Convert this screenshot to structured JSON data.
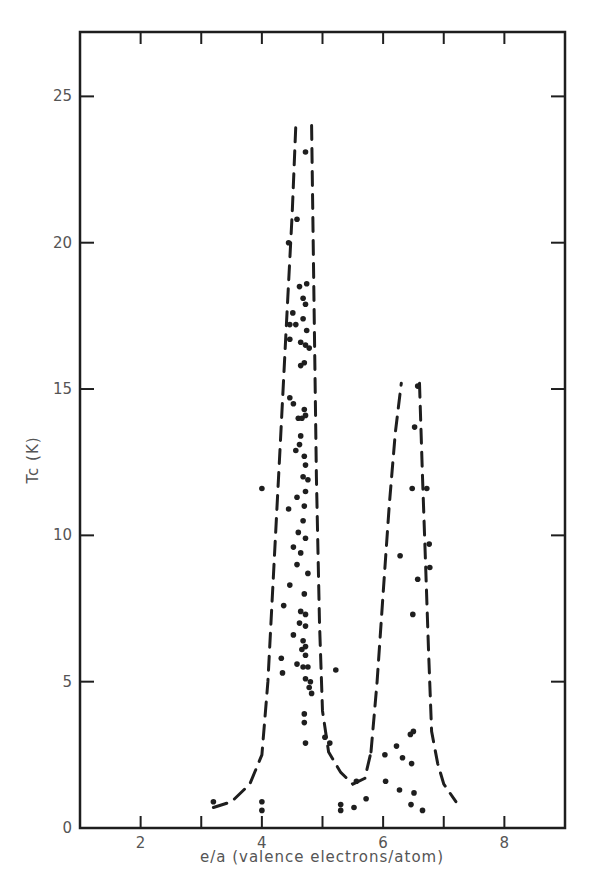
{
  "chart_data": {
    "type": "scatter",
    "title": "",
    "xlabel": "e/a (valence electrons/atom)",
    "ylabel": "Tc (K)",
    "xlim": [
      1,
      9
    ],
    "ylim": [
      0,
      27.2
    ],
    "x_ticks": [
      2,
      3,
      4,
      5,
      6,
      7,
      8
    ],
    "x_tick_labels": [
      "2",
      "",
      "4",
      "",
      "6",
      "",
      "8"
    ],
    "y_ticks": [
      0,
      5,
      10,
      15,
      20,
      25
    ],
    "y_tick_labels": [
      "0",
      "5",
      "10",
      "15",
      "20",
      "25"
    ],
    "grid": false,
    "legend": null,
    "series": [
      {
        "name": "superconductors",
        "style": "scatter",
        "points": [
          [
            3.2,
            0.9
          ],
          [
            4.0,
            0.9
          ],
          [
            4.0,
            0.6
          ],
          [
            4.0,
            11.6
          ],
          [
            4.72,
            23.1
          ],
          [
            4.58,
            20.8
          ],
          [
            4.44,
            20.0
          ],
          [
            4.62,
            18.5
          ],
          [
            4.74,
            18.6
          ],
          [
            4.68,
            18.1
          ],
          [
            4.72,
            17.9
          ],
          [
            4.51,
            17.6
          ],
          [
            4.68,
            17.4
          ],
          [
            4.56,
            17.2
          ],
          [
            4.46,
            17.2
          ],
          [
            4.74,
            17.0
          ],
          [
            4.46,
            16.7
          ],
          [
            4.64,
            16.6
          ],
          [
            4.72,
            16.5
          ],
          [
            4.78,
            16.4
          ],
          [
            4.7,
            15.9
          ],
          [
            4.64,
            15.8
          ],
          [
            4.46,
            14.7
          ],
          [
            4.52,
            14.5
          ],
          [
            4.7,
            14.3
          ],
          [
            4.6,
            14.0
          ],
          [
            4.66,
            14.0
          ],
          [
            4.72,
            14.1
          ],
          [
            4.64,
            13.4
          ],
          [
            4.62,
            13.1
          ],
          [
            4.56,
            12.9
          ],
          [
            4.7,
            12.7
          ],
          [
            4.72,
            12.4
          ],
          [
            4.68,
            12.0
          ],
          [
            4.76,
            11.9
          ],
          [
            4.58,
            11.3
          ],
          [
            4.72,
            11.5
          ],
          [
            4.7,
            11.0
          ],
          [
            4.44,
            10.9
          ],
          [
            4.68,
            10.5
          ],
          [
            4.6,
            10.1
          ],
          [
            4.72,
            9.9
          ],
          [
            4.52,
            9.6
          ],
          [
            4.64,
            9.4
          ],
          [
            4.58,
            9.0
          ],
          [
            4.76,
            8.7
          ],
          [
            4.46,
            8.3
          ],
          [
            4.7,
            8.0
          ],
          [
            4.36,
            7.6
          ],
          [
            4.64,
            7.4
          ],
          [
            4.72,
            7.3
          ],
          [
            4.62,
            7.0
          ],
          [
            4.72,
            6.9
          ],
          [
            4.52,
            6.6
          ],
          [
            4.68,
            6.4
          ],
          [
            4.66,
            6.1
          ],
          [
            4.72,
            5.9
          ],
          [
            4.72,
            6.2
          ],
          [
            4.32,
            5.8
          ],
          [
            4.58,
            5.6
          ],
          [
            4.68,
            5.5
          ],
          [
            4.76,
            5.5
          ],
          [
            4.34,
            5.3
          ],
          [
            4.72,
            5.1
          ],
          [
            4.8,
            5.0
          ],
          [
            4.78,
            4.8
          ],
          [
            4.82,
            4.6
          ],
          [
            5.22,
            5.4
          ],
          [
            4.7,
            3.9
          ],
          [
            4.7,
            3.6
          ],
          [
            5.04,
            3.1
          ],
          [
            4.72,
            2.9
          ],
          [
            5.12,
            2.9
          ],
          [
            5.3,
            0.8
          ],
          [
            5.3,
            0.6
          ],
          [
            5.52,
            0.7
          ],
          [
            5.72,
            1.0
          ],
          [
            5.56,
            1.6
          ],
          [
            6.03,
            2.5
          ],
          [
            6.04,
            1.6
          ],
          [
            6.22,
            2.8
          ],
          [
            6.32,
            2.4
          ],
          [
            6.45,
            3.2
          ],
          [
            6.5,
            3.3
          ],
          [
            6.27,
            1.3
          ],
          [
            6.47,
            2.2
          ],
          [
            6.51,
            1.2
          ],
          [
            6.46,
            0.8
          ],
          [
            6.65,
            0.6
          ],
          [
            6.28,
            9.3
          ],
          [
            6.48,
            11.6
          ],
          [
            6.49,
            7.3
          ],
          [
            6.57,
            8.5
          ],
          [
            6.57,
            15.1
          ],
          [
            6.52,
            13.7
          ],
          [
            6.72,
            11.6
          ],
          [
            6.76,
            9.7
          ],
          [
            6.77,
            8.9
          ]
        ]
      },
      {
        "name": "envelope-peak-1",
        "style": "dashed",
        "points": [
          [
            3.2,
            0.7
          ],
          [
            3.5,
            0.9
          ],
          [
            3.8,
            1.5
          ],
          [
            4.0,
            2.5
          ],
          [
            4.1,
            5.0
          ],
          [
            4.2,
            9.0
          ],
          [
            4.3,
            13.0
          ],
          [
            4.4,
            17.0
          ],
          [
            4.5,
            21.0
          ],
          [
            4.56,
            24.0
          ]
        ]
      },
      {
        "name": "envelope-peak-1-right",
        "style": "dashed",
        "points": [
          [
            4.82,
            24.0
          ],
          [
            4.86,
            18.0
          ],
          [
            4.9,
            12.0
          ],
          [
            4.95,
            7.0
          ],
          [
            5.0,
            4.0
          ],
          [
            5.1,
            2.6
          ],
          [
            5.3,
            1.9
          ],
          [
            5.5,
            1.5
          ],
          [
            5.7,
            1.7
          ],
          [
            5.8,
            2.6
          ]
        ]
      },
      {
        "name": "envelope-peak-2",
        "style": "dashed",
        "points": [
          [
            5.8,
            2.6
          ],
          [
            5.9,
            5.0
          ],
          [
            6.0,
            8.0
          ],
          [
            6.1,
            11.0
          ],
          [
            6.2,
            13.5
          ],
          [
            6.3,
            15.2
          ]
        ]
      },
      {
        "name": "envelope-peak-2-right",
        "style": "dashed",
        "points": [
          [
            6.6,
            15.2
          ],
          [
            6.65,
            12.0
          ],
          [
            6.7,
            9.0
          ],
          [
            6.75,
            6.0
          ],
          [
            6.8,
            3.3
          ],
          [
            6.9,
            2.2
          ],
          [
            7.0,
            1.5
          ],
          [
            7.2,
            0.9
          ]
        ]
      }
    ]
  }
}
